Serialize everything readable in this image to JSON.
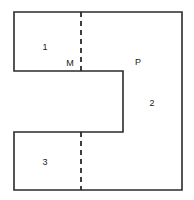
{
  "figure": {
    "canvas": {
      "width": 194,
      "height": 200,
      "background": "#ffffff"
    },
    "style": {
      "outline_color": "#2b2b2b",
      "outline_width": 1.6,
      "dash_color": "#2b2b2b",
      "dash_width": 1.8,
      "dash_pattern": "5 4",
      "label_color": "#1a1a1a",
      "label_font_size": 9
    },
    "outline": {
      "name": "c-shape-outline",
      "points": "14,12 182,12 182,190 14,190 14,132 123,132 123,71 14,71",
      "closed": true
    },
    "divider": {
      "name": "dashed-divider",
      "x": 81,
      "segments": [
        {
          "y1": 12,
          "y2": 71
        },
        {
          "y1": 132,
          "y2": 190
        }
      ]
    },
    "labels": [
      {
        "id": "region-1",
        "text": "1",
        "x": 45,
        "y": 47
      },
      {
        "id": "point-m",
        "text": "M",
        "x": 70,
        "y": 63
      },
      {
        "id": "point-p",
        "text": "P",
        "x": 138,
        "y": 62
      },
      {
        "id": "region-2",
        "text": "2",
        "x": 152,
        "y": 103
      },
      {
        "id": "region-3",
        "text": "3",
        "x": 45,
        "y": 162
      }
    ]
  }
}
